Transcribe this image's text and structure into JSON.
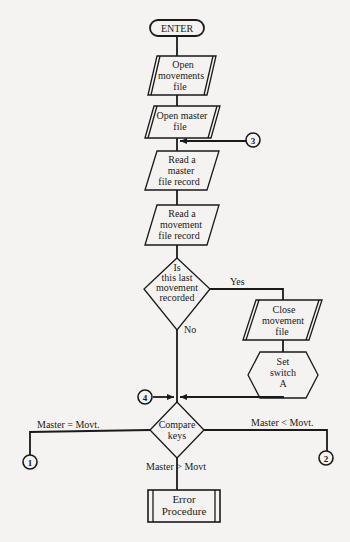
{
  "diagram": {
    "type": "flowchart",
    "nodes": {
      "enter": {
        "label": "ENTER",
        "shape": "terminal"
      },
      "open_movements": {
        "lines": [
          "Open",
          "movements",
          "file"
        ],
        "shape": "io-parallelogram-double"
      },
      "open_master": {
        "lines": [
          "Open master",
          "file"
        ],
        "shape": "io-parallelogram-double"
      },
      "read_master": {
        "lines": [
          "Read a",
          "master",
          "file record"
        ],
        "shape": "io-parallelogram"
      },
      "read_movement": {
        "lines": [
          "Read a",
          "movement",
          "file record"
        ],
        "shape": "io-parallelogram"
      },
      "decision_last": {
        "lines": [
          "Is",
          "this last",
          "movement",
          "recorded"
        ],
        "shape": "decision"
      },
      "close_movement": {
        "lines": [
          "Close",
          "movement",
          "file"
        ],
        "shape": "io-parallelogram-double"
      },
      "set_switch": {
        "lines": [
          "Set",
          "switch",
          "A"
        ],
        "shape": "preparation-hexagon"
      },
      "compare_keys": {
        "lines": [
          "Compare",
          "keys"
        ],
        "shape": "decision"
      },
      "error_procedure": {
        "lines": [
          "Error",
          "Procedure"
        ],
        "shape": "predefined-process"
      }
    },
    "connectors": {
      "c1": "1",
      "c2": "2",
      "c3": "3",
      "c4": "4"
    },
    "edge_labels": {
      "yes": "Yes",
      "no": "No",
      "master_eq": "Master = Movt.",
      "master_lt": "Master < Movt.",
      "master_gt": "Master > Movt"
    }
  }
}
